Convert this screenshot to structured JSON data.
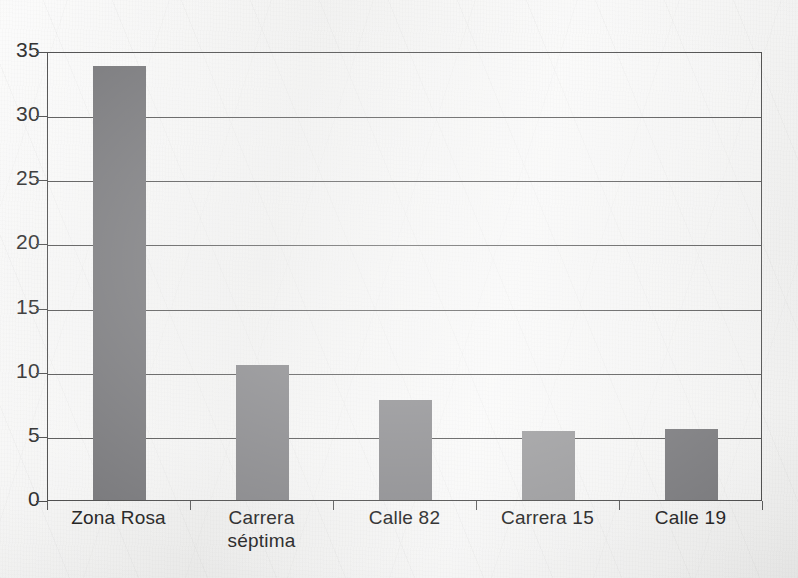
{
  "chart_data": {
    "type": "bar",
    "title": "",
    "xlabel": "",
    "ylabel": "",
    "categories": [
      "Zona Rosa",
      "Carrera séptima",
      "Calle 82",
      "Carrera 15",
      "Calle 19"
    ],
    "category_lines": [
      [
        "Zona Rosa"
      ],
      [
        "Carrera",
        "séptima"
      ],
      [
        "Calle 82"
      ],
      [
        "Carrera 15"
      ],
      [
        "Calle 19"
      ]
    ],
    "values": [
      33.8,
      10.5,
      7.8,
      5.4,
      5.5
    ],
    "ylim": [
      0,
      35
    ],
    "yticks": [
      0,
      5,
      10,
      15,
      20,
      25,
      30,
      35
    ],
    "ytick_labels": [
      "0",
      "5",
      "10",
      "15",
      "20",
      "25",
      "30",
      "35"
    ],
    "grid": true,
    "grid_axis": "y",
    "legend": null,
    "bar_colors": [
      "#77777a",
      "#858588",
      "#8b8b8e",
      "#9a9a9c",
      "#79797c"
    ]
  },
  "style": {
    "axis_color": "#4d4d4d",
    "grid_color": "#555555",
    "text_color": "#242424",
    "page_background": "#ececeb"
  }
}
